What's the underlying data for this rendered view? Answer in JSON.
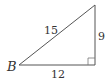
{
  "diagram": {
    "type": "right-triangle",
    "vertex_label": "B",
    "sides": {
      "hypotenuse": "15",
      "vertical": "9",
      "base": "12"
    },
    "right_angle_marker": true,
    "stroke_color": "#555555"
  }
}
